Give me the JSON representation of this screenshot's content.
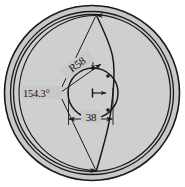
{
  "drawing": {
    "title": "circular-part-section-view",
    "background_color": "#ffffff",
    "body_fill_color": "#c9c9c9",
    "rim_fill_color": "#c2c2c2",
    "line_color": "#1a1a1a",
    "dimensions": [
      {
        "name": "radius-callout",
        "label": "R58",
        "type": "radius",
        "value": 58,
        "unit": "mm",
        "rotation_deg": -35
      },
      {
        "name": "angle-callout",
        "label": "154.3°",
        "type": "angle",
        "value": 154.3,
        "unit": "deg"
      },
      {
        "name": "width-callout",
        "label": "38",
        "type": "linear",
        "value": 38,
        "unit": "mm"
      }
    ],
    "geometry": {
      "outer_circle": {
        "cx": 92,
        "cy": 93,
        "r": 88
      },
      "rim_inner_circle": {
        "cx": 92,
        "cy": 93,
        "r": 80
      },
      "body_circle": {
        "cx": 92,
        "cy": 93,
        "r": 77
      },
      "bore_circle": {
        "cx": 92,
        "cy": 93,
        "r": 25
      },
      "arc_center": {
        "cx": 59,
        "cy": 93
      },
      "arc_radius": 58
    }
  }
}
